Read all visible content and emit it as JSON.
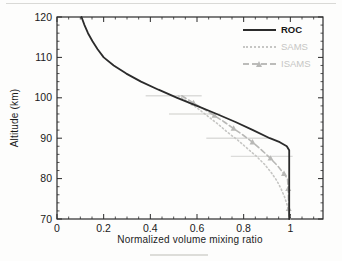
{
  "chart_data": {
    "type": "line",
    "title": "",
    "xlabel": "Normalized volume mixing ratio",
    "ylabel": "Altitude (km)",
    "xlim": [
      0,
      1.14
    ],
    "ylim": [
      70,
      120
    ],
    "x_major_ticks": [
      0,
      0.2,
      0.4,
      0.6,
      0.8,
      1
    ],
    "x_tick_labels": [
      "0",
      "0.2",
      "0.4",
      "0.6",
      "0.8",
      "1"
    ],
    "x_minor_step": 0.05,
    "y_major_ticks": [
      70,
      80,
      90,
      100,
      110,
      120
    ],
    "y_tick_labels": [
      "70",
      "80",
      "90",
      "100",
      "110",
      "120"
    ],
    "y_minor_step": 2,
    "grid": false,
    "legend_position": "upper-right-inside-no-frame",
    "axis_color": "#2a2a2a",
    "tick_label_color": "#1a1a1a",
    "series": [
      {
        "name": "ROC",
        "style": "solid",
        "color": "#2b2b2b",
        "width": 1.8,
        "points": [
          [
            0.105,
            120
          ],
          [
            0.118,
            118
          ],
          [
            0.133,
            116
          ],
          [
            0.152,
            114
          ],
          [
            0.174,
            112
          ],
          [
            0.2,
            110
          ],
          [
            0.243,
            108
          ],
          [
            0.297,
            106
          ],
          [
            0.36,
            104
          ],
          [
            0.435,
            102
          ],
          [
            0.515,
            100
          ],
          [
            0.6,
            98
          ],
          [
            0.685,
            96
          ],
          [
            0.765,
            94
          ],
          [
            0.84,
            92
          ],
          [
            0.912,
            90
          ],
          [
            0.955,
            89
          ],
          [
            0.985,
            88
          ],
          [
            0.995,
            87
          ],
          [
            0.995,
            80
          ],
          [
            0.995,
            75
          ],
          [
            0.995,
            70
          ]
        ]
      },
      {
        "name": "SAMS",
        "style": "dotted",
        "color": "#c6c6c4",
        "width": 1.6,
        "points": [
          [
            0.52,
            100.5
          ],
          [
            0.56,
            99
          ],
          [
            0.6,
            97.5
          ],
          [
            0.645,
            95.5
          ],
          [
            0.69,
            93.5
          ],
          [
            0.73,
            91.5
          ],
          [
            0.775,
            89.5
          ],
          [
            0.815,
            87.5
          ],
          [
            0.855,
            85.5
          ],
          [
            0.89,
            83.5
          ],
          [
            0.918,
            81.5
          ],
          [
            0.942,
            79.5
          ],
          [
            0.96,
            77.5
          ],
          [
            0.975,
            75.5
          ],
          [
            0.986,
            73.5
          ],
          [
            0.994,
            71.5
          ],
          [
            0.999,
            70
          ]
        ]
      },
      {
        "name": "ISAMS",
        "style": "dashed",
        "color": "#b8b8b6",
        "width": 1.6,
        "marker": "triangle",
        "marker_every": 2,
        "points": [
          [
            0.535,
            100.5
          ],
          [
            0.585,
            98.7
          ],
          [
            0.63,
            97.2
          ],
          [
            0.675,
            95.6
          ],
          [
            0.717,
            94
          ],
          [
            0.757,
            92.4
          ],
          [
            0.797,
            90.8
          ],
          [
            0.838,
            89
          ],
          [
            0.878,
            87
          ],
          [
            0.915,
            85
          ],
          [
            0.948,
            83
          ],
          [
            0.973,
            81.2
          ],
          [
            0.988,
            80
          ],
          [
            0.991,
            77.5
          ],
          [
            0.992,
            75
          ],
          [
            0.993,
            72.5
          ],
          [
            0.994,
            70
          ]
        ]
      }
    ],
    "error_bars": {
      "color": "#dcdcda",
      "bars": [
        {
          "altitude": 100.5,
          "x_min": 0.38,
          "x_max": 0.62
        },
        {
          "altitude": 96.0,
          "x_min": 0.48,
          "x_max": 0.7
        },
        {
          "altitude": 90.0,
          "x_min": 0.64,
          "x_max": 0.91
        },
        {
          "altitude": 85.5,
          "x_min": 0.745,
          "x_max": 1.01
        }
      ]
    }
  }
}
